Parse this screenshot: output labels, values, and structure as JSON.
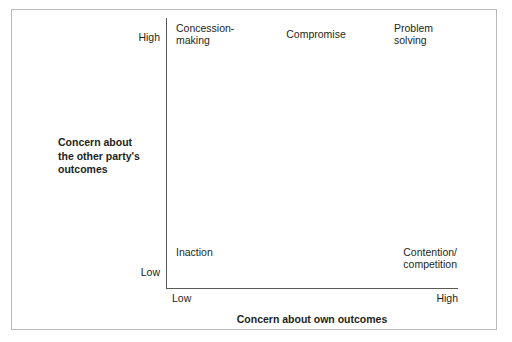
{
  "figure": {
    "type": "dual-concern-model-matrix",
    "axes": {
      "y": {
        "title": "Concern about\nthe other party's\noutcomes",
        "ticks": {
          "high": "High",
          "low": "Low"
        }
      },
      "x": {
        "title": "Concern about own outcomes",
        "ticks": {
          "low": "Low",
          "high": "High"
        }
      }
    },
    "quadrants": {
      "top_left": "Concession-\nmaking",
      "top_center": "Compromise",
      "top_right": "Problem\nsolving",
      "bottom_left": "Inaction",
      "bottom_right": "Contention/\ncompetition"
    },
    "colors": {
      "text": "#231f20",
      "axis_line": "#58595b",
      "frame_border": "#b9b9b9",
      "background": "#ffffff"
    }
  },
  "chart_data": {
    "type": "scatter",
    "title": "",
    "xlabel": "Concern about own outcomes",
    "ylabel": "Concern about the other party's outcomes",
    "xlim": [
      "Low",
      "High"
    ],
    "ylim": [
      "Low",
      "High"
    ],
    "grid": false,
    "legend": "none",
    "annotations": [
      {
        "label": "Concession-making",
        "x": "Low",
        "y": "High"
      },
      {
        "label": "Compromise",
        "x": "Medium",
        "y": "High"
      },
      {
        "label": "Problem solving",
        "x": "High",
        "y": "High"
      },
      {
        "label": "Inaction",
        "x": "Low",
        "y": "Low"
      },
      {
        "label": "Contention/competition",
        "x": "High",
        "y": "Low"
      }
    ]
  }
}
